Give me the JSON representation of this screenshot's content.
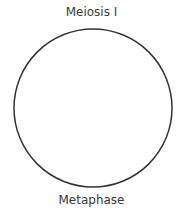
{
  "diagram": {
    "title": "Meiosis I",
    "caption": "Metaphase",
    "cell": {
      "shape": "circle",
      "stroke": "#333333",
      "fill": "#ffffff"
    }
  }
}
